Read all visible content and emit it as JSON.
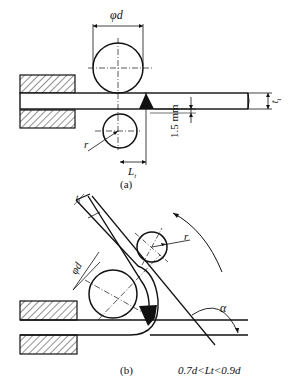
{
  "figure_a": {
    "diameter_label": "φd",
    "thickness_label": "t",
    "thickness_sub": "t",
    "gap_label": "1.5 mm",
    "radius_label": "r",
    "length_label": "L",
    "length_sub": "t",
    "caption": "(a)"
  },
  "figure_b": {
    "thickness_label": "t",
    "thickness_sub": "t",
    "diameter_label": "φd",
    "radius_label": "r",
    "angle_label": "α",
    "caption": "(b)",
    "condition": "0.7d<Lt<0.9d"
  }
}
